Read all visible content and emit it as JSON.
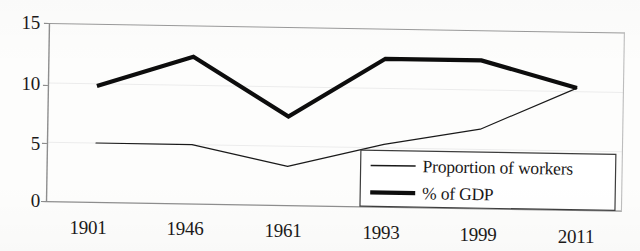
{
  "chart_data": {
    "type": "line",
    "title": "",
    "subtitle": "",
    "xlabel": "",
    "ylabel": "",
    "categories": [
      "1901",
      "1946",
      "1961",
      "1993",
      "1999",
      "2011"
    ],
    "series": [
      {
        "name": "Proportion of workers",
        "values": [
          5.0,
          5.0,
          3.3,
          5.3,
          6.7,
          10.3
        ],
        "style": "thin-line",
        "color": "#1a1a1a",
        "line_width": 1.2
      },
      {
        "name": "% of GDP",
        "values": [
          9.8,
          12.4,
          7.5,
          12.5,
          12.5,
          10.3
        ],
        "style": "thick-line",
        "color": "#0d0d0d",
        "line_width": 4.2
      }
    ],
    "ylim": [
      0,
      15
    ],
    "yticks": [
      0,
      5,
      10,
      15
    ],
    "ytick_labels": [
      "0",
      "5",
      "10",
      "15"
    ],
    "grid": true,
    "grid_axis": "y",
    "grid_color": "#e8e8e8",
    "legend_position": "lower-right-inside",
    "axis_color": "#8a8a8a",
    "background_color": "#fdfdfc"
  },
  "legend": {
    "items": [
      {
        "label": "Proportion of workers",
        "swatch": "thin-line-swatch"
      },
      {
        "label": "% of GDP",
        "swatch": "thick-line-swatch"
      }
    ]
  },
  "axes": {
    "y_tick_labels": [
      "15",
      "10",
      "5",
      "0"
    ],
    "x_tick_labels": [
      "1901",
      "1946",
      "1961",
      "1993",
      "1999",
      "2011"
    ]
  }
}
